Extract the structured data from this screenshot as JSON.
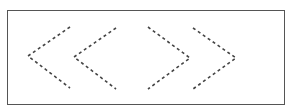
{
  "diagram": {
    "frame": {
      "x": 7,
      "y": 10,
      "width": 278,
      "height": 95,
      "border_color": "#555555"
    },
    "stroke_color": "#444444",
    "dash": "3,3",
    "chevrons": [
      {
        "name": "chevron-left-1",
        "direction": "left",
        "points": "70,27 28,56 70,88"
      },
      {
        "name": "chevron-left-2",
        "direction": "left",
        "points": "116,28 74,57 116,89"
      },
      {
        "name": "chevron-right-1",
        "direction": "right",
        "points": "148,27 190,58 148,89"
      },
      {
        "name": "chevron-right-2",
        "direction": "right",
        "points": "193,28 236,58 193,89"
      }
    ]
  }
}
